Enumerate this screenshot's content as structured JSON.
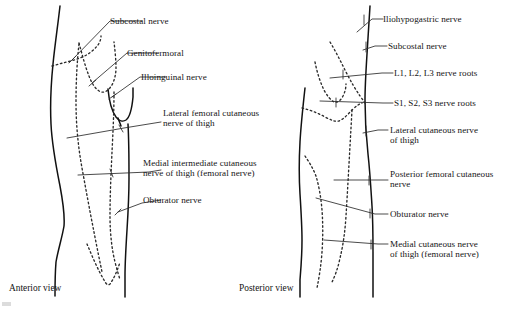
{
  "figure": {
    "background_color": "#ffffff",
    "line_color": "#111111",
    "dashed_line_color": "#2b2b2b",
    "leader_color": "#2a2a2a",
    "text_color": "#141414"
  },
  "views": [
    {
      "id": "anterior",
      "caption": "Anterior view"
    },
    {
      "id": "posterior",
      "caption": "Posterior view"
    }
  ],
  "anterior": {
    "caption": "Anterior view",
    "labels": [
      {
        "id": "subcostal",
        "line1": "Subcostal nerve",
        "line2": ""
      },
      {
        "id": "genitofemoral",
        "line1": "Genitofermoral",
        "line2": ""
      },
      {
        "id": "ilioinguinal",
        "line1": "Illoinguinal nerve",
        "line2": ""
      },
      {
        "id": "lateral-femoral-cutaneous",
        "line1": "Lateral femoral cutaneous",
        "line2": "nerve of thigh"
      },
      {
        "id": "medial-intermediate-cutaneous",
        "line1": "Medial intermediate cutaneous",
        "line2": "nerve of thigh (femoral nerve)"
      },
      {
        "id": "obturator",
        "line1": "Obturator nerve",
        "line2": ""
      }
    ]
  },
  "posterior": {
    "caption": "Posterior view",
    "labels": [
      {
        "id": "iliohypogastric",
        "line1": "Iliohypogastric nerve",
        "line2": ""
      },
      {
        "id": "subcostal",
        "line1": "Subcostal nerve",
        "line2": ""
      },
      {
        "id": "lumbar-roots",
        "line1": "L1, L2, L3 nerve roots",
        "line2": ""
      },
      {
        "id": "sacral-roots",
        "line1": "S1, S2, S3 nerve roots",
        "line2": ""
      },
      {
        "id": "lateral-cutaneous",
        "line1": "Lateral cutaneous nerve",
        "line2": "of thigh"
      },
      {
        "id": "posterior-femoral-cutaneous",
        "line1": "Posterior femoral cutaneous",
        "line2": "nerve"
      },
      {
        "id": "obturator",
        "line1": "Obturator nerve",
        "line2": ""
      },
      {
        "id": "medial-cutaneous",
        "line1": "Medial cutaneous nerve",
        "line2": "of thigh (femoral nerve)"
      }
    ]
  }
}
